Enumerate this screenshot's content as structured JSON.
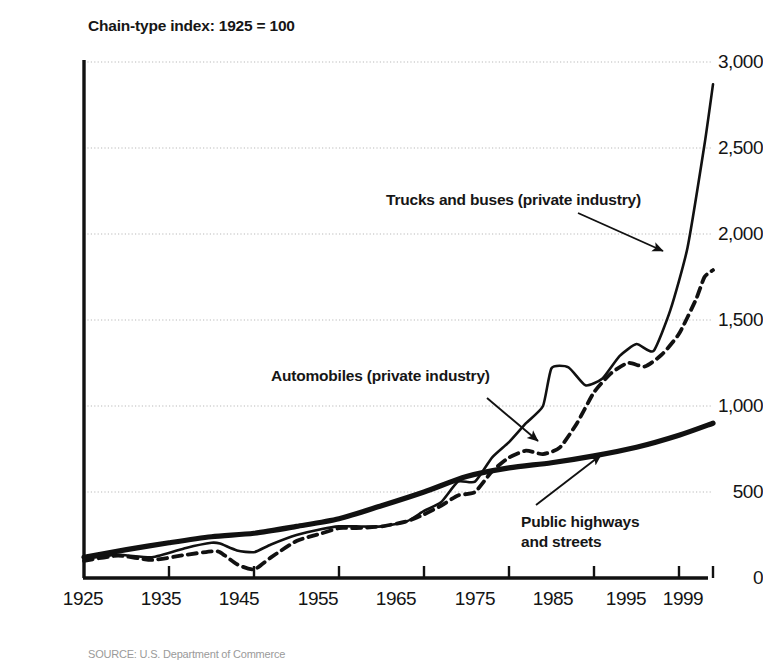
{
  "chart_data": {
    "type": "line",
    "title": "Chain-type index: 1925 = 100",
    "subtitle": "",
    "xlabel": "",
    "ylabel": "",
    "xlim": [
      1925,
      1999
    ],
    "ylim": [
      0,
      3000
    ],
    "grid": true,
    "legend_position": "inline-annotations",
    "y_ticks": [
      "0",
      "500",
      "1,000",
      "1,500",
      "2,000",
      "2,500",
      "3,000"
    ],
    "y_tick_values": [
      0,
      500,
      1000,
      1500,
      2000,
      2500,
      3000
    ],
    "x_ticks": [
      "1925",
      "1935",
      "1945",
      "1955",
      "1965",
      "1975",
      "1985",
      "1995",
      "1999"
    ],
    "x_tick_values": [
      1925,
      1935,
      1945,
      1955,
      1965,
      1975,
      1985,
      1995,
      1999
    ],
    "series": [
      {
        "name": "Trucks and buses (private industry)",
        "style": "solid-thin",
        "x": [
          1925,
          1929,
          1933,
          1937,
          1940,
          1941,
          1943,
          1945,
          1947,
          1950,
          1953,
          1955,
          1957,
          1960,
          1963,
          1965,
          1967,
          1969,
          1971,
          1973,
          1975,
          1977,
          1979,
          1980,
          1982,
          1984,
          1986,
          1988,
          1990,
          1992,
          1994,
          1996,
          1998,
          1999
        ],
        "values": [
          110,
          135,
          120,
          175,
          205,
          200,
          160,
          150,
          195,
          250,
          285,
          300,
          300,
          300,
          330,
          390,
          440,
          560,
          560,
          700,
          790,
          900,
          1000,
          1220,
          1225,
          1120,
          1160,
          1290,
          1360,
          1320,
          1560,
          1920,
          2520,
          2870
        ]
      },
      {
        "name": "Automobiles (private industry)",
        "style": "dashed",
        "x": [
          1925,
          1929,
          1933,
          1937,
          1940,
          1941,
          1943,
          1945,
          1947,
          1950,
          1953,
          1955,
          1957,
          1960,
          1963,
          1965,
          1967,
          1969,
          1971,
          1973,
          1975,
          1977,
          1979,
          1981,
          1983,
          1985,
          1987,
          1989,
          1991,
          1993,
          1995,
          1997,
          1998,
          1999
        ],
        "values": [
          100,
          130,
          105,
          135,
          155,
          150,
          80,
          50,
          120,
          215,
          260,
          290,
          290,
          300,
          330,
          370,
          420,
          480,
          500,
          620,
          700,
          740,
          720,
          760,
          900,
          1080,
          1190,
          1250,
          1230,
          1300,
          1420,
          1620,
          1750,
          1790
        ]
      },
      {
        "name": "Public highways and streets",
        "style": "solid-thick",
        "x": [
          1925,
          1930,
          1935,
          1940,
          1945,
          1950,
          1955,
          1960,
          1965,
          1970,
          1975,
          1980,
          1985,
          1990,
          1995,
          1999
        ],
        "values": [
          120,
          165,
          205,
          240,
          260,
          300,
          345,
          420,
          500,
          590,
          640,
          670,
          710,
          760,
          830,
          900
        ]
      }
    ],
    "annotations": [
      {
        "id": "trucks",
        "text": "Trucks and buses (private industry)",
        "target_series": "Trucks and buses (private industry)"
      },
      {
        "id": "automobiles",
        "text": "Automobiles (private industry)",
        "target_series": "Automobiles (private industry)"
      },
      {
        "id": "highways",
        "text": "Public highways\nand streets",
        "target_series": "Public highways and streets"
      }
    ]
  },
  "source": {
    "text": "SOURCE: U.S. Department of Commerce"
  },
  "colors": {
    "line": "#111111",
    "grid": "#b9b9b9",
    "axis": "#111111",
    "text": "#161616",
    "background": "#ffffff"
  }
}
